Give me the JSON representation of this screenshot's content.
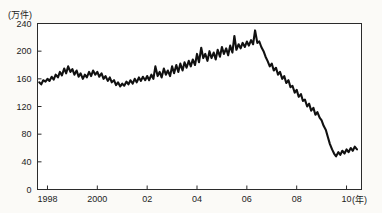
{
  "chart_data": {
    "type": "line",
    "title": "",
    "subtitle": "",
    "xlabel": "(年)",
    "ylabel": "(万件)",
    "y_unit_label": "(万件)",
    "x_unit_label": "(年)",
    "xlim": [
      1997.6,
      2010.6
    ],
    "ylim": [
      0,
      240
    ],
    "grid": false,
    "legend": false,
    "legend_position": "none",
    "line_color": "#111111",
    "frame_color": "#2b2b2b",
    "background_color": "#ffffff",
    "yticks": [
      0,
      40,
      80,
      120,
      160,
      200,
      240
    ],
    "ytick_labels": [
      "0",
      "40",
      "80",
      "120",
      "160",
      "200",
      "240"
    ],
    "xticks": [
      1998,
      2000,
      2002,
      2004,
      2006,
      2008,
      2010
    ],
    "xtick_labels": [
      "1998",
      "2000",
      "02",
      "04",
      "06",
      "08",
      "10"
    ],
    "series": [
      {
        "name": "件数",
        "x": [
          1997.67,
          1997.75,
          1997.83,
          1997.92,
          1998.0,
          1998.08,
          1998.17,
          1998.25,
          1998.33,
          1998.42,
          1998.5,
          1998.58,
          1998.67,
          1998.75,
          1998.83,
          1998.92,
          1999.0,
          1999.08,
          1999.17,
          1999.25,
          1999.33,
          1999.42,
          1999.5,
          1999.58,
          1999.67,
          1999.75,
          1999.83,
          1999.92,
          2000.0,
          2000.08,
          2000.17,
          2000.25,
          2000.33,
          2000.42,
          2000.5,
          2000.58,
          2000.67,
          2000.75,
          2000.83,
          2000.92,
          2001.0,
          2001.08,
          2001.17,
          2001.25,
          2001.33,
          2001.42,
          2001.5,
          2001.58,
          2001.67,
          2001.75,
          2001.83,
          2001.92,
          2002.0,
          2002.08,
          2002.17,
          2002.25,
          2002.33,
          2002.42,
          2002.5,
          2002.58,
          2002.67,
          2002.75,
          2002.83,
          2002.92,
          2003.0,
          2003.08,
          2003.17,
          2003.25,
          2003.33,
          2003.42,
          2003.5,
          2003.58,
          2003.67,
          2003.75,
          2003.83,
          2003.92,
          2004.0,
          2004.08,
          2004.17,
          2004.25,
          2004.33,
          2004.42,
          2004.5,
          2004.58,
          2004.67,
          2004.75,
          2004.83,
          2004.92,
          2005.0,
          2005.08,
          2005.17,
          2005.25,
          2005.33,
          2005.42,
          2005.5,
          2005.58,
          2005.67,
          2005.75,
          2005.83,
          2005.92,
          2006.0,
          2006.08,
          2006.17,
          2006.25,
          2006.33,
          2006.42,
          2006.5,
          2006.58,
          2006.67,
          2006.75,
          2006.83,
          2006.92,
          2007.0,
          2007.08,
          2007.17,
          2007.25,
          2007.33,
          2007.42,
          2007.5,
          2007.58,
          2007.67,
          2007.75,
          2007.83,
          2007.92,
          2008.0,
          2008.08,
          2008.17,
          2008.25,
          2008.33,
          2008.42,
          2008.5,
          2008.58,
          2008.67,
          2008.75,
          2008.83,
          2008.92,
          2009.0,
          2009.08,
          2009.17,
          2009.25,
          2009.33,
          2009.42,
          2009.5,
          2009.58,
          2009.67,
          2009.75,
          2009.83,
          2009.92,
          2010.0,
          2010.08,
          2010.17,
          2010.25,
          2010.33,
          2010.42
        ],
        "values": [
          155,
          152,
          158,
          156,
          160,
          157,
          163,
          159,
          166,
          162,
          170,
          165,
          175,
          168,
          178,
          170,
          174,
          166,
          172,
          163,
          168,
          160,
          166,
          162,
          170,
          164,
          172,
          166,
          170,
          163,
          168,
          160,
          164,
          157,
          162,
          155,
          158,
          151,
          155,
          149,
          153,
          150,
          156,
          152,
          158,
          153,
          160,
          155,
          162,
          157,
          163,
          158,
          164,
          158,
          166,
          160,
          178,
          164,
          170,
          162,
          175,
          166,
          172,
          164,
          178,
          168,
          180,
          170,
          182,
          172,
          184,
          176,
          186,
          178,
          188,
          180,
          196,
          184,
          205,
          190,
          196,
          186,
          200,
          190,
          198,
          188,
          202,
          192,
          206,
          196,
          204,
          194,
          208,
          198,
          222,
          202,
          210,
          204,
          212,
          206,
          214,
          208,
          216,
          210,
          230,
          212,
          214,
          206,
          200,
          192,
          186,
          178,
          182,
          172,
          176,
          166,
          170,
          160,
          164,
          154,
          158,
          148,
          150,
          140,
          144,
          134,
          138,
          128,
          130,
          120,
          124,
          114,
          118,
          108,
          112,
          104,
          100,
          92,
          86,
          76,
          66,
          58,
          52,
          48,
          54,
          50,
          56,
          52,
          58,
          54,
          60,
          56,
          62,
          58
        ]
      }
    ],
    "annotations": [
      {
        "text": "plateau 1998-2002 around 150-180"
      },
      {
        "text": "peak approximately 230 in 2005"
      },
      {
        "text": "sharp decline 2006-2008"
      },
      {
        "text": "flat near 50-58 from 2009"
      }
    ]
  }
}
